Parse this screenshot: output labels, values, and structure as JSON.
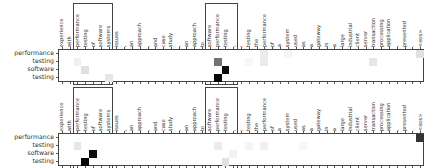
{
  "columns": [
    "experience",
    "with",
    "performance",
    "testing",
    "of",
    "software",
    "systems",
    "issues",
    ",",
    "an",
    "approach",
    ",",
    "and",
    "case",
    "study",
    ",",
    "an",
    "approach",
    "to",
    "software",
    "performance",
    "testing",
    ",",
    ":",
    "testing",
    "the",
    "performance",
    "of",
    "a",
    "system",
    "used",
    "as",
    "a",
    "gateway",
    "in",
    "a",
    "large",
    "industrial",
    "client",
    "server",
    "transaction",
    "processing",
    "application",
    ",",
    "presented",
    ".",
    "<eos>"
  ],
  "rows": [
    "performance",
    "testing",
    "software",
    "testing"
  ],
  "highlight_columns": [
    [
      2,
      6
    ],
    [
      19,
      22
    ]
  ],
  "panels": [
    {
      "name": "top",
      "cells": [
        {
          "r": 1,
          "c": 2,
          "v": 0.06
        },
        {
          "r": 2,
          "c": 3,
          "v": 0.12
        },
        {
          "r": 3,
          "c": 6,
          "v": 0.1
        },
        {
          "r": 1,
          "c": 20,
          "v": 0.55
        },
        {
          "r": 2,
          "c": 21,
          "v": 0.95
        },
        {
          "r": 3,
          "c": 20,
          "v": 0.97
        },
        {
          "r": 0,
          "c": 26,
          "v": 0.08
        },
        {
          "r": 1,
          "c": 26,
          "v": 0.08
        },
        {
          "r": 0,
          "c": 29,
          "v": 0.04
        },
        {
          "r": 1,
          "c": 40,
          "v": 0.1
        },
        {
          "r": 0,
          "c": 46,
          "v": 0.12
        },
        {
          "r": 1,
          "c": 24,
          "v": 0.03
        }
      ]
    },
    {
      "name": "bottom",
      "cells": [
        {
          "r": 1,
          "c": 2,
          "v": 0.1
        },
        {
          "r": 2,
          "c": 4,
          "v": 0.95
        },
        {
          "r": 3,
          "c": 3,
          "v": 0.97
        },
        {
          "r": 1,
          "c": 20,
          "v": 0.08
        },
        {
          "r": 3,
          "c": 21,
          "v": 0.12
        },
        {
          "r": 2,
          "c": 22,
          "v": 0.05
        },
        {
          "r": 1,
          "c": 24,
          "v": 0.04
        },
        {
          "r": 1,
          "c": 26,
          "v": 0.06
        },
        {
          "r": 1,
          "c": 31,
          "v": 0.03
        },
        {
          "r": 0,
          "c": 46,
          "v": 0.8
        }
      ]
    }
  ]
}
